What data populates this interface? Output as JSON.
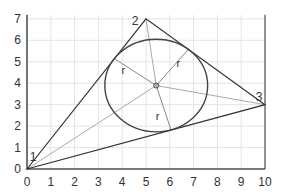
{
  "diagram": {
    "axes": {
      "x_ticks": [
        "0",
        "1",
        "2",
        "3",
        "4",
        "5",
        "6",
        "7",
        "8",
        "9",
        "10"
      ],
      "y_ticks": [
        "0",
        "1",
        "2",
        "3",
        "4",
        "5",
        "6",
        "7"
      ],
      "xlim": [
        0,
        10
      ],
      "ylim": [
        0,
        7
      ],
      "grid": true
    },
    "vertices": [
      {
        "label": "1",
        "x": 0,
        "y": 0
      },
      {
        "label": "2",
        "x": 5,
        "y": 7
      },
      {
        "label": "3",
        "x": 10,
        "y": 3
      }
    ],
    "incenter": {
      "x": 5.43,
      "y": 3.89
    },
    "inradius": 2.16,
    "radius_label": "r",
    "colors": {
      "grid": "#e4e4e4",
      "axis": "#555555",
      "triangle": "#333333",
      "circle": "#444444",
      "bisector": "#aaaaaa",
      "radius_line": "#888888",
      "text": "#333333"
    }
  }
}
